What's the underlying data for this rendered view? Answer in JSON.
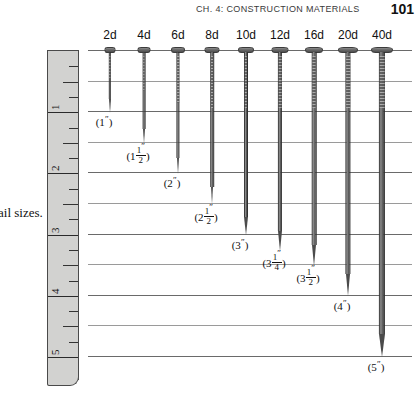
{
  "runhead": {
    "chapter_title": "CH. 4: CONSTRUCTION MATERIALS",
    "page_number": "101"
  },
  "caption": {
    "text": "ail sizes."
  },
  "ruler": {
    "name": "vertical-inch-ruler",
    "unit": "inch",
    "numbers": [
      "1",
      "2",
      "3",
      "4",
      "5"
    ],
    "tick_pattern": [
      "quarter",
      "half",
      "quarter",
      "full"
    ],
    "fill_color": "#d2d2d0",
    "edge_color": "#4a4a4a"
  },
  "grid": {
    "line_color": "#6a6a6a",
    "minor_line_color": "#9a9a9a",
    "spacing_inches": 0.5
  },
  "chart_data": {
    "type": "bar",
    "xlabel": "Penny size",
    "ylabel": "Length (inches)",
    "ylim": [
      0,
      5.5
    ],
    "grid": true,
    "legend": "none",
    "orientation": "vertical-down",
    "categories": [
      "2d",
      "4d",
      "6d",
      "8d",
      "10d",
      "12d",
      "16d",
      "20d",
      "40d"
    ],
    "values": [
      1,
      1.5,
      2,
      2.5,
      3,
      3.25,
      3.5,
      4,
      5
    ],
    "value_labels": [
      "(1\")",
      "(1 1/2\")",
      "(2\")",
      "(2 1/2\")",
      "(3\")",
      "(3 1/4\")",
      "(3 1/2\")",
      "(4\")",
      "(5\")"
    ],
    "tick_labels_y": [
      "1",
      "2",
      "3",
      "4",
      "5"
    ]
  },
  "nails": [
    {
      "size": "2d",
      "length_in": 1.0,
      "whole": "1",
      "num": "",
      "den": "",
      "shank_w": 2.4,
      "head_w": 11
    },
    {
      "size": "4d",
      "length_in": 1.5,
      "whole": "1",
      "num": "1",
      "den": "2",
      "shank_w": 2.8,
      "head_w": 13
    },
    {
      "size": "6d",
      "length_in": 2.0,
      "whole": "2",
      "num": "",
      "den": "",
      "shank_w": 3.2,
      "head_w": 14
    },
    {
      "size": "8d",
      "length_in": 2.5,
      "whole": "2",
      "num": "1",
      "den": "2",
      "shank_w": 3.6,
      "head_w": 15
    },
    {
      "size": "10d",
      "length_in": 3.0,
      "whole": "3",
      "num": "",
      "den": "",
      "shank_w": 4.0,
      "head_w": 16
    },
    {
      "size": "12d",
      "length_in": 3.25,
      "whole": "3",
      "num": "1",
      "den": "4",
      "shank_w": 4.2,
      "head_w": 17
    },
    {
      "size": "16d",
      "length_in": 3.5,
      "whole": "3",
      "num": "1",
      "den": "2",
      "shank_w": 4.6,
      "head_w": 18
    },
    {
      "size": "20d",
      "length_in": 4.0,
      "whole": "4",
      "num": "",
      "den": "",
      "shank_w": 5.2,
      "head_w": 20
    },
    {
      "size": "40d",
      "length_in": 5.0,
      "whole": "5",
      "num": "",
      "den": "",
      "shank_w": 6.2,
      "head_w": 22
    }
  ]
}
